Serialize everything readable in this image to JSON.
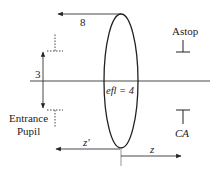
{
  "diagram": {
    "type": "optical-layout",
    "labels": {
      "height_marker": "8",
      "pupil_half_height": "3",
      "entrance_pupil_line1": "Entrance",
      "entrance_pupil_line2": "Pupil",
      "lens_label": "efl = 4",
      "aperture_stop": "Astop",
      "clear_aperture": "CA",
      "z_prime": "z'",
      "z": "z"
    },
    "elements": [
      {
        "name": "lens",
        "shape": "ellipse",
        "label": "efl = 4"
      },
      {
        "name": "optical-axis",
        "shape": "line"
      },
      {
        "name": "entrance-pupil",
        "shape": "dimension-arrow",
        "value": "3"
      },
      {
        "name": "height-8-arrow",
        "shape": "arrow-left",
        "value": "8"
      },
      {
        "name": "aperture-stop",
        "shape": "stop-marks",
        "label": "Astop"
      },
      {
        "name": "clear-aperture",
        "shape": "stop-marks",
        "label": "CA"
      },
      {
        "name": "z-prime-arrow",
        "shape": "arrow-left",
        "label": "z'"
      },
      {
        "name": "z-arrow",
        "shape": "arrow-right",
        "label": "z"
      }
    ],
    "colors": {
      "stroke": "#222222",
      "background": "#ffffff"
    }
  }
}
